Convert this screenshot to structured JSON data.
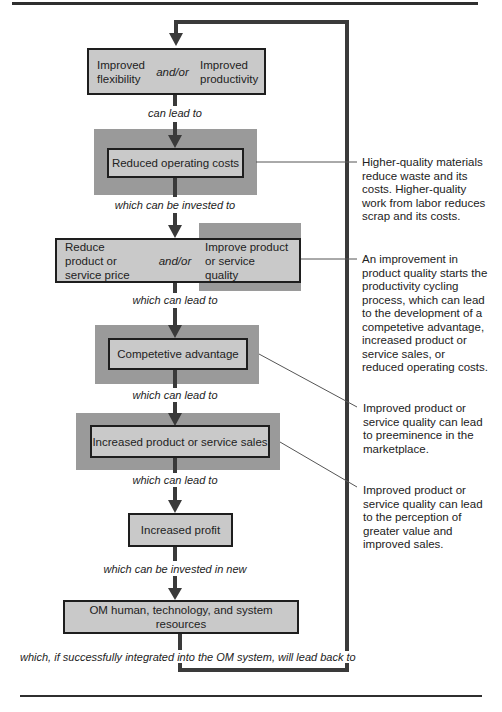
{
  "diagram": {
    "type": "flowchart-cycle",
    "nodes": [
      {
        "id": "n1",
        "left": "Improved flexibility",
        "joiner": "and/or",
        "right": "Improved productivity"
      },
      {
        "id": "n2",
        "label": "Reduced operating costs",
        "highlighted": true
      },
      {
        "id": "n3",
        "left": "Reduce product or service price",
        "joiner": "and/or",
        "right": "Improve product or service quality",
        "right_highlighted": true
      },
      {
        "id": "n4",
        "label": "Competetive advantage",
        "highlighted": true
      },
      {
        "id": "n5",
        "label": "Increased product or service sales",
        "highlighted": true
      },
      {
        "id": "n6",
        "label": "Increased profit"
      },
      {
        "id": "n7",
        "label": "OM human, technology, and system resources"
      }
    ],
    "connectors": [
      "can lead to",
      "which can be invested to",
      "which can lead to",
      "which can lead to",
      "which can lead to",
      "which can be invested in new",
      "which, if successfully integrated into the OM system, will lead back to"
    ],
    "notes": [
      {
        "target": "n2",
        "text_lines": [
          "Higher-quality materials",
          "reduce waste and its",
          "costs. Higher-quality",
          "work from labor reduces",
          "scrap and its costs."
        ]
      },
      {
        "target": "n3",
        "text_lines": [
          "An improvement in",
          "product quality starts the",
          "productivity cycling",
          "process, which can lead",
          "to the development of a",
          "competetive advantage,",
          "increased product or",
          "service sales, or",
          "reduced operating costs."
        ]
      },
      {
        "target": "n4",
        "text_lines": [
          "Improved product or",
          "service quality can lead",
          "to preeminence in the",
          "marketplace."
        ]
      },
      {
        "target": "n5",
        "text_lines": [
          "Improved product or",
          "service quality can lead",
          "to the perception of",
          "greater value and",
          "improved sales."
        ]
      }
    ],
    "colors": {
      "box_fill": "#c9c9c9",
      "highlight_fill": "#9a9a9a",
      "line": "#2f2f2f"
    }
  }
}
